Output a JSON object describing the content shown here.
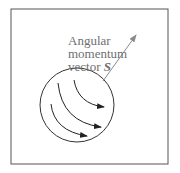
{
  "diagram": {
    "label_lines": [
      "Angular",
      "momentum",
      "vector "
    ],
    "vector_symbol": "S",
    "colors": {
      "border": "#555555",
      "circle": "#333333",
      "curved_arrows": "#222222",
      "vector_arrow": "#8a8a8a",
      "label_text": "#6f6f6f"
    }
  }
}
